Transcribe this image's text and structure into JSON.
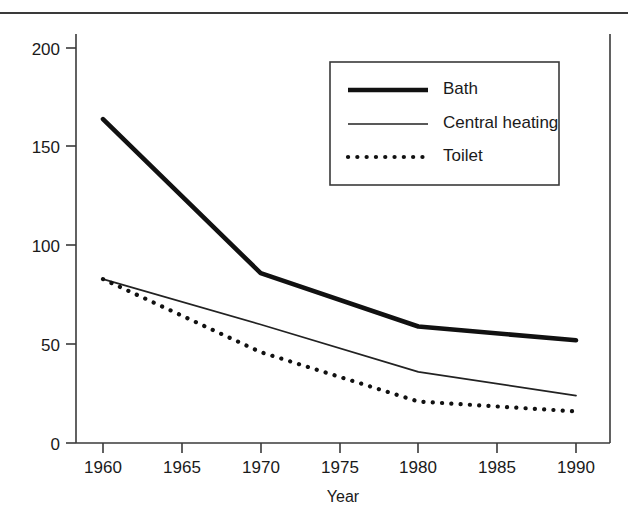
{
  "chart_data": {
    "type": "line",
    "title": "",
    "subtitle": "",
    "xlabel": "Year",
    "ylabel": "",
    "x": [
      1960,
      1970,
      1980,
      1990
    ],
    "xlim": [
      1958.5,
      1992.5
    ],
    "ylim": [
      0,
      210
    ],
    "xticks": [
      1960,
      1965,
      1970,
      1975,
      1980,
      1985,
      1990
    ],
    "xtick_labels": [
      "1960",
      "1965",
      "1970",
      "1975",
      "1980",
      "1985",
      "1990"
    ],
    "yticks": [
      0,
      50,
      100,
      150,
      200
    ],
    "ytick_labels": [
      "0",
      "50",
      "100",
      "150",
      "200"
    ],
    "grid": false,
    "legend_position": "upper right",
    "series": [
      {
        "name": "Bath",
        "style": "thick-solid",
        "color": "#111111",
        "values": [
          164,
          86,
          59,
          52
        ]
      },
      {
        "name": "Central heating",
        "style": "thin-solid",
        "color": "#222222",
        "values": [
          83,
          60,
          36,
          24
        ]
      },
      {
        "name": "Toilet",
        "style": "dotted",
        "color": "#111111",
        "values": [
          83,
          46,
          21,
          16
        ]
      }
    ],
    "legend_entries": [
      {
        "label": "Bath",
        "style": "thick-solid"
      },
      {
        "label": "Central heating",
        "style": "thin-solid"
      },
      {
        "label": "Toilet",
        "style": "dotted"
      }
    ]
  },
  "colors": {
    "axis": "#3a3a3a",
    "ink": "#1a1a1a",
    "background": "#ffffff",
    "legend_border": "#3a3a3a"
  }
}
